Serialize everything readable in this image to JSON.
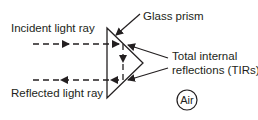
{
  "diagram": {
    "labels": {
      "glass_prism": "Glass prism",
      "incident_ray": "Incident light ray",
      "reflected_ray": "Reflected light ray",
      "tir_line1": "Total internal",
      "tir_line2": "reflections (TIRs)",
      "medium": "Air"
    },
    "colors": {
      "stroke": "#231f20",
      "background": "#ffffff"
    }
  }
}
